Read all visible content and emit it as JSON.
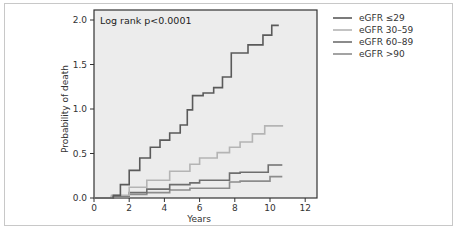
{
  "chart_data": {
    "type": "line",
    "title": "",
    "annotation": "Log rank p<0.0001",
    "xlabel": "Years",
    "ylabel": "Probability of death",
    "xlim": [
      0,
      12.5
    ],
    "ylim": [
      0,
      2.0
    ],
    "x_ticks": [
      "0",
      "2",
      "4",
      "6",
      "8",
      "10",
      "12"
    ],
    "y_ticks": [
      "0.0",
      "0.5",
      "1.0",
      "1.5",
      "2.0"
    ],
    "grid": false,
    "legend_position": "right",
    "step": true,
    "series": [
      {
        "name": "eGFR ≤29",
        "color": "#5a5a5a",
        "x": [
          0,
          1.0,
          1.1,
          1.5,
          2.0,
          2.6,
          3.2,
          3.75,
          4.3,
          4.9,
          5.3,
          5.6,
          6.2,
          6.8,
          7.3,
          7.8,
          8.75,
          9.6,
          10.1,
          10.5
        ],
        "y": [
          0,
          0.0,
          0.03,
          0.15,
          0.31,
          0.45,
          0.57,
          0.65,
          0.73,
          0.82,
          0.99,
          1.15,
          1.18,
          1.24,
          1.36,
          1.63,
          1.72,
          1.83,
          1.94,
          1.94
        ]
      },
      {
        "name": "eGFR 30–59",
        "color": "#b4b4b4",
        "x": [
          0,
          1.0,
          2.0,
          3.0,
          4.3,
          5.45,
          6.0,
          7.0,
          7.7,
          8.3,
          9.0,
          9.7,
          10.7
        ],
        "y": [
          0,
          0.03,
          0.12,
          0.2,
          0.3,
          0.38,
          0.45,
          0.51,
          0.57,
          0.63,
          0.72,
          0.81,
          0.82
        ]
      },
      {
        "name": "eGFR 60–89",
        "color": "#6e6e6e",
        "x": [
          0,
          1.0,
          2.0,
          3.0,
          4.3,
          5.45,
          6.0,
          7.7,
          8.3,
          9.9,
          10.7
        ],
        "y": [
          0,
          0.02,
          0.06,
          0.1,
          0.15,
          0.17,
          0.2,
          0.28,
          0.29,
          0.37,
          0.37
        ]
      },
      {
        "name": "eGFR >90",
        "color": "#8c8c8c",
        "x": [
          0,
          1.0,
          2.0,
          3.0,
          4.3,
          5.45,
          7.7,
          8.3,
          10.0,
          10.7
        ],
        "y": [
          0,
          0.01,
          0.04,
          0.06,
          0.09,
          0.11,
          0.18,
          0.19,
          0.24,
          0.24
        ]
      }
    ]
  }
}
